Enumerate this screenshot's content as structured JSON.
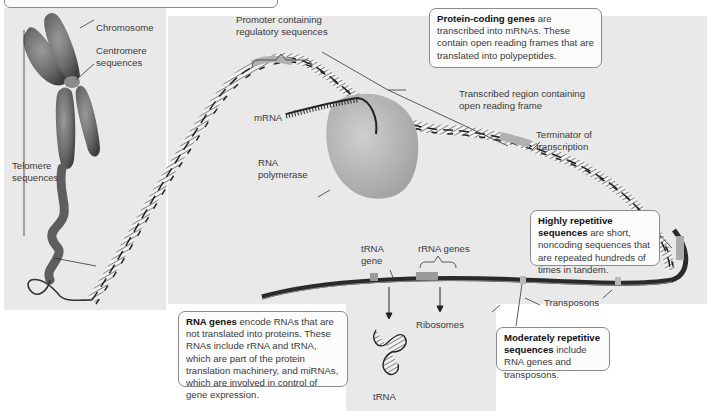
{
  "figure": {
    "panels": [
      "chromosome-panel",
      "main-dna-panel",
      "rna-genes-panel"
    ]
  },
  "labels": {
    "chromosome": "Chromosome",
    "centromere": "Centromere\nsequences",
    "telomere": "Telomere\nsequences",
    "promoter": "Promoter containing\nregulatory sequences",
    "transcribed_region": "Transcribed region containing\nopen reading frame",
    "mrna": "mRNA",
    "rna_polymerase": "RNA\npolymerase",
    "terminator": "Terminator of\ntranscription",
    "trna_gene": "tRNA\ngene",
    "rrna_genes": "rRNA genes",
    "ribosomes": "Ribosomes",
    "trna": "tRNA",
    "transposons": "Transposons"
  },
  "callouts": {
    "protein_coding": {
      "bold": "Protein-coding genes",
      "text": " are transcribed into mRNAs. These contain open reading frames that are translated into polypeptides."
    },
    "highly_repetitive": {
      "bold": "Highly repetitive sequences",
      "text": " are short, noncoding sequences that are repeated hundreds of times in tandem."
    },
    "rna_genes": {
      "bold": "RNA genes",
      "text": " encode RNAs that are not translated into proteins. These RNAs include rRNA and tRNA, which are part of the protein translation machinery, and miRNAs, which are involved in control of gene expression."
    },
    "moderately_repetitive": {
      "bold": "Moderately repetitive sequences",
      "text": " include RNA genes and transposons."
    }
  },
  "colors": {
    "panel_bg": "#e9e9e9",
    "dna_dark": "#2a2a2a",
    "dna_light": "#a8a8a8",
    "chromosome": "#6e6e6e",
    "polymerase": "#bdbdbd",
    "callout_border": "#8a8a8a"
  }
}
